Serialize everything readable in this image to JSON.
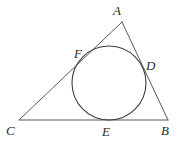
{
  "figure": {
    "kind": "incircle-of-triangle",
    "width": 181,
    "height": 143,
    "background_color": "#ffffff",
    "line_color": "#58585a",
    "circle_color": "#3d3d3f",
    "label_color": "#2b2b2b"
  },
  "labels": {
    "apex": "A",
    "bottom_left": "C",
    "bottom_right": "B",
    "tangent_left": "F",
    "tangent_right": "D",
    "tangent_bottom": "E"
  },
  "chart_data": {
    "type": "scatter",
    "title": "",
    "xlabel": "",
    "ylabel": "",
    "points": [
      {
        "name": "A",
        "x": 122,
        "y": 22,
        "role": "triangle-vertex"
      },
      {
        "name": "B",
        "x": 168,
        "y": 120,
        "role": "triangle-vertex"
      },
      {
        "name": "C",
        "x": 19,
        "y": 120,
        "role": "triangle-vertex"
      },
      {
        "name": "D",
        "x": 143,
        "y": 66,
        "role": "tangent-point-on-AB"
      },
      {
        "name": "E",
        "x": 109,
        "y": 120,
        "role": "tangent-point-on-CB"
      },
      {
        "name": "F",
        "x": 88,
        "y": 55,
        "role": "tangent-point-on-CA"
      }
    ],
    "segments": [
      {
        "name": "CA",
        "from": "C",
        "to": "A"
      },
      {
        "name": "AB",
        "from": "A",
        "to": "B"
      },
      {
        "name": "CB",
        "from": "C",
        "to": "B"
      }
    ],
    "circle": {
      "cx": 109,
      "cy": 83,
      "r": 37,
      "name": "incircle"
    }
  },
  "geometry": {
    "A": {
      "x": 122,
      "y": 22
    },
    "B": {
      "x": 168,
      "y": 120
    },
    "C": {
      "x": 19,
      "y": 120
    },
    "D": {
      "x": 143,
      "y": 66
    },
    "E": {
      "x": 109,
      "y": 120
    },
    "F": {
      "x": 88,
      "y": 55
    },
    "circle": {
      "cx": 109,
      "cy": 83,
      "r": 37
    },
    "label_positions": {
      "A": {
        "x": 117,
        "y": 15
      },
      "B": {
        "x": 161,
        "y": 135
      },
      "C": {
        "x": 6,
        "y": 135
      },
      "D": {
        "x": 146,
        "y": 70
      },
      "E": {
        "x": 102,
        "y": 136
      },
      "F": {
        "x": 74,
        "y": 58
      }
    }
  }
}
